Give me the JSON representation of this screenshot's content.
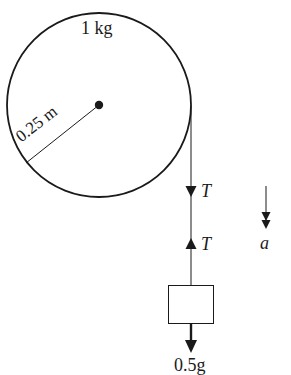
{
  "diagram": {
    "type": "pulley-mass-system",
    "pulley": {
      "mass_label": "1 kg",
      "radius_label": "0.25 m"
    },
    "string": {
      "tension_on_pulley_label": "T",
      "tension_on_mass_label": "T"
    },
    "hanging_mass": {
      "weight_label": "0.5g"
    },
    "acceleration": {
      "label": "a"
    },
    "colors": {
      "ink": "#1a1a1a",
      "background": "#ffffff"
    }
  }
}
